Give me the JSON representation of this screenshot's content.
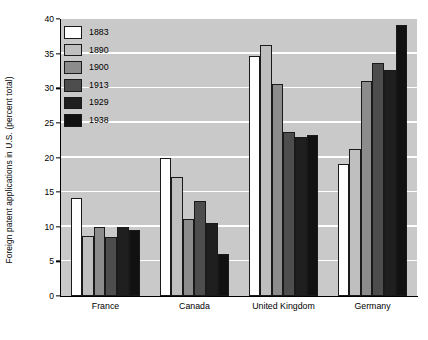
{
  "chart_data": {
    "type": "bar",
    "title": "",
    "xlabel": "",
    "ylabel": "Foreign patent applications in U.S. (percent total)",
    "categories": [
      "France",
      "Canada",
      "United Kingdom",
      "Germany"
    ],
    "ylim": [
      0,
      40
    ],
    "yticks": [
      0,
      5,
      10,
      15,
      20,
      25,
      30,
      35,
      40
    ],
    "grid": "horizontal",
    "legend_position": "top-left-inside",
    "series": [
      {
        "name": "1883",
        "color": "#ffffff",
        "values": [
          14.2,
          20.0,
          34.7,
          19.1
        ]
      },
      {
        "name": "1890",
        "color": "#bfbfbf",
        "values": [
          8.7,
          17.2,
          36.2,
          21.3
        ]
      },
      {
        "name": "1900",
        "color": "#8c8c8c",
        "values": [
          9.9,
          11.1,
          30.6,
          31.0
        ]
      },
      {
        "name": "1913",
        "color": "#4d4d4d",
        "values": [
          8.5,
          13.7,
          23.7,
          33.7
        ]
      },
      {
        "name": "1929",
        "color": "#1f1f1f",
        "values": [
          10.0,
          10.5,
          22.9,
          32.7
        ]
      },
      {
        "name": "1938",
        "color": "#111111",
        "values": [
          9.6,
          6.0,
          23.3,
          39.1
        ]
      }
    ]
  },
  "colors": {
    "plot_background": "#c9c9c9",
    "gridline": "#ffffff",
    "axis": "#000000",
    "bar_outline": "#1a1a1a",
    "page_background": "#ffffff"
  }
}
